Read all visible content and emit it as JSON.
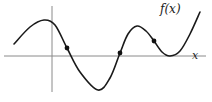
{
  "figure": {
    "function_label": "f(x)",
    "x_axis_label": "x",
    "colors": {
      "curve": "#1a1a1a",
      "axis": "#8a8a8a",
      "point": "#111111",
      "background": "#ffffff"
    }
  },
  "chart_data": {
    "type": "line",
    "title": "",
    "curve_label": "f(x)",
    "xlabel": "x",
    "ylabel": "",
    "axes": {
      "x_axis_pixel_y": 56,
      "y_axis_pixel_x": 52
    },
    "curve_pixels": [
      [
        14,
        44
      ],
      [
        30,
        27
      ],
      [
        44,
        20
      ],
      [
        55,
        25
      ],
      [
        67,
        48
      ],
      [
        80,
        72
      ],
      [
        98,
        90
      ],
      [
        110,
        78
      ],
      [
        120,
        53
      ],
      [
        128,
        34
      ],
      [
        137,
        26
      ],
      [
        146,
        31
      ],
      [
        154,
        41
      ],
      [
        162,
        52
      ],
      [
        170,
        56
      ],
      [
        180,
        51
      ],
      [
        190,
        34
      ],
      [
        200,
        12
      ]
    ],
    "marked_points": [
      {
        "name": "inflection-1",
        "px": [
          67,
          48
        ]
      },
      {
        "name": "root-crossing",
        "px": [
          120,
          53
        ]
      },
      {
        "name": "inflection-2",
        "px": [
          154,
          41
        ]
      }
    ],
    "features": {
      "local_max_1": [
        44,
        20
      ],
      "local_min_1": [
        98,
        90
      ],
      "local_max_2": [
        137,
        26
      ],
      "tangent_touch_root": [
        170,
        56
      ]
    },
    "grid": false,
    "legend": "none"
  }
}
